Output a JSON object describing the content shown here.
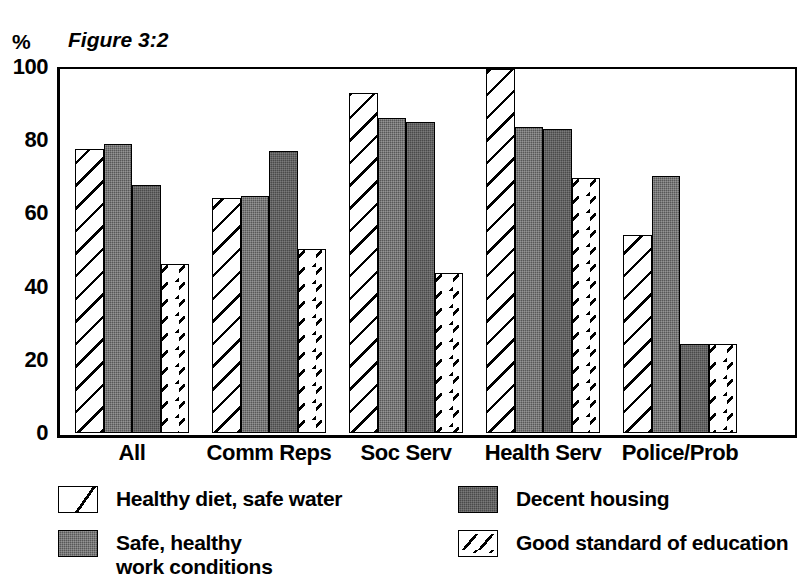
{
  "chart_data": {
    "type": "bar",
    "title": "Figure 3:2",
    "unit_label": "%",
    "xlabel": "",
    "ylabel": "%",
    "ylim": [
      0,
      100
    ],
    "yticks": [
      0,
      20,
      40,
      60,
      80,
      100
    ],
    "grid": false,
    "legend_position": "bottom",
    "categories": [
      "All",
      "Comm Reps",
      "Soc Serv",
      "Health Serv",
      "Police/Prob"
    ],
    "series": [
      {
        "name": "Healthy diet, safe water",
        "pattern": "diagonal-hatch",
        "color": "#ffffff",
        "values": [
          78,
          64.5,
          93.5,
          100,
          54.5
        ]
      },
      {
        "name": "Safe, healthy\nwork conditions",
        "pattern": "grey-stipple",
        "color": "#585858",
        "values": [
          79.5,
          65,
          86.5,
          84,
          70.5
        ]
      },
      {
        "name": "Decent housing",
        "pattern": "dark-grey-stipple",
        "color": "#4a4a4a",
        "values": [
          68,
          77.5,
          85.5,
          83.5,
          24.5
        ]
      },
      {
        "name": "Good standard of education",
        "pattern": "dashed-diagonal",
        "color": "#ffffff",
        "values": [
          46.5,
          50.5,
          44,
          70,
          24.5
        ]
      }
    ]
  },
  "axis": {
    "unit": "%",
    "ticks": [
      "100",
      "80",
      "60",
      "40",
      "20",
      "0"
    ]
  },
  "title": {
    "text": "Figure 3:2"
  },
  "xaxis": {
    "labels": [
      "All",
      "Comm Reps",
      "Soc Serv",
      "Health Serv",
      "Police/Prob"
    ]
  },
  "legend": {
    "items": [
      {
        "label": "Healthy diet, safe water",
        "swatch": "hatch-swatch"
      },
      {
        "label": "Decent housing",
        "swatch": "grey-swatch"
      },
      {
        "label": "Safe, healthy\nwork conditions",
        "swatch": "grey-swatch"
      },
      {
        "label": "Good standard of education",
        "swatch": "dash-swatch"
      }
    ]
  }
}
